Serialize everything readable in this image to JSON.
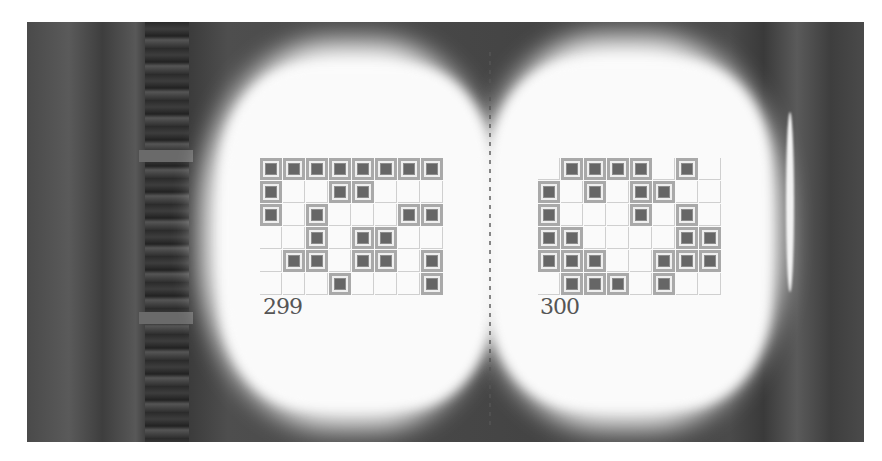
{
  "scene": {
    "description": "Open book on a shelf with two pages showing tile-grid puzzles",
    "colors": {
      "tile_outer": "#a9a9a9",
      "tile_inner": "#666666",
      "grid_line": "#cfcfcf",
      "page": "#fafafa",
      "background": "#444444"
    }
  },
  "left_page": {
    "page_number": "299",
    "grid": {
      "cols": 8,
      "rows": 6,
      "cells": [
        [
          1,
          1,
          1,
          1,
          1,
          1,
          1,
          1
        ],
        [
          1,
          0,
          0,
          1,
          1,
          0,
          0,
          0
        ],
        [
          1,
          0,
          1,
          0,
          0,
          0,
          1,
          1
        ],
        [
          0,
          0,
          1,
          0,
          1,
          1,
          0,
          0
        ],
        [
          0,
          1,
          1,
          0,
          1,
          1,
          0,
          1
        ],
        [
          0,
          0,
          0,
          1,
          0,
          0,
          0,
          1
        ]
      ]
    }
  },
  "right_page": {
    "page_number": "300",
    "grid": {
      "cols": 8,
      "rows": 6,
      "cells": [
        [
          0,
          1,
          1,
          1,
          1,
          0,
          1,
          0
        ],
        [
          1,
          0,
          1,
          0,
          1,
          1,
          0,
          0
        ],
        [
          1,
          0,
          0,
          0,
          1,
          0,
          1,
          0
        ],
        [
          1,
          1,
          0,
          0,
          0,
          0,
          1,
          1
        ],
        [
          1,
          1,
          1,
          0,
          0,
          1,
          1,
          1
        ],
        [
          0,
          1,
          1,
          1,
          0,
          1,
          0,
          0
        ]
      ]
    }
  }
}
